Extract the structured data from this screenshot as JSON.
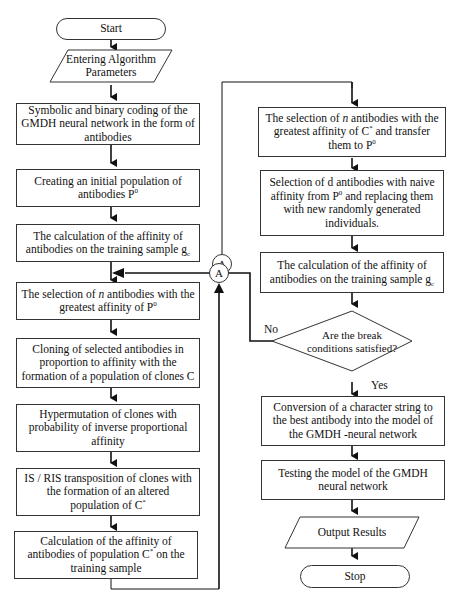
{
  "flowchart": {
    "left_column": [
      {
        "id": "start",
        "type": "terminal",
        "text": "Start"
      },
      {
        "id": "input_params",
        "type": "io",
        "text": "Entering Algorithm Parameters"
      },
      {
        "id": "coding",
        "type": "process",
        "text": "Symbolic and binary coding of the GMDH neural network in the form of antibodies"
      },
      {
        "id": "init_pop",
        "type": "process",
        "text": "Creating an initial population of antibodies P",
        "sup": "0"
      },
      {
        "id": "calc_affinity_1",
        "type": "process",
        "text": "The calculation of the affinity of antibodies on the training sample g",
        "sub": "c"
      },
      {
        "id": "select_n",
        "type": "process",
        "text_pre": "The selection of ",
        "text_it": "n",
        "text_post": " antibodies with the greatest affinity of P",
        "sup": "0"
      },
      {
        "id": "cloning",
        "type": "process",
        "text": "Cloning of selected antibodies in proportion to affinity with the formation of a population of clones C"
      },
      {
        "id": "hypermutation",
        "type": "process",
        "text": "Hypermutation of clones with probability of inverse proportional affinity"
      },
      {
        "id": "transposition",
        "type": "process",
        "text": "IS / RIS transposition of clones with the formation of an altered population of C",
        "sup": "*"
      },
      {
        "id": "calc_affinity_c",
        "type": "process",
        "text_pre": "Calculation of the affinity of antibodies of population C",
        "sup": "*",
        "text_post": " on the training sample"
      }
    ],
    "right_column": [
      {
        "id": "select_n_c",
        "type": "process",
        "text_pre": "The selection of ",
        "text_it": "n",
        "text_mid": " antibodies with the greatest affinity of C",
        "sup1": "*",
        "text_mid2": " and transfer them to P",
        "sup2": "0"
      },
      {
        "id": "replace_d",
        "type": "process",
        "text_pre": "Selection of d antibodies with naive affinity from P",
        "sup": "0",
        "text_post": " and replacing them with new randomly generated individuals."
      },
      {
        "id": "calc_affinity_2",
        "type": "process",
        "text": "The calculation of the affinity of antibodies on the training sample g",
        "sub": "c"
      },
      {
        "id": "decision",
        "type": "decision",
        "text": "Are the break conditions satisfied?"
      },
      {
        "id": "conversion",
        "type": "process",
        "text": "Conversion of a character string to the best antibody into the model of the GMDH -neural network"
      },
      {
        "id": "testing",
        "type": "process",
        "text": "Testing the model of the GMDH neural network"
      },
      {
        "id": "output",
        "type": "io",
        "text": "Output Results"
      },
      {
        "id": "stop",
        "type": "terminal",
        "text": "Stop"
      }
    ],
    "connectors": {
      "a_label": "A"
    },
    "branch_labels": {
      "no": "No",
      "yes": "Yes"
    }
  }
}
